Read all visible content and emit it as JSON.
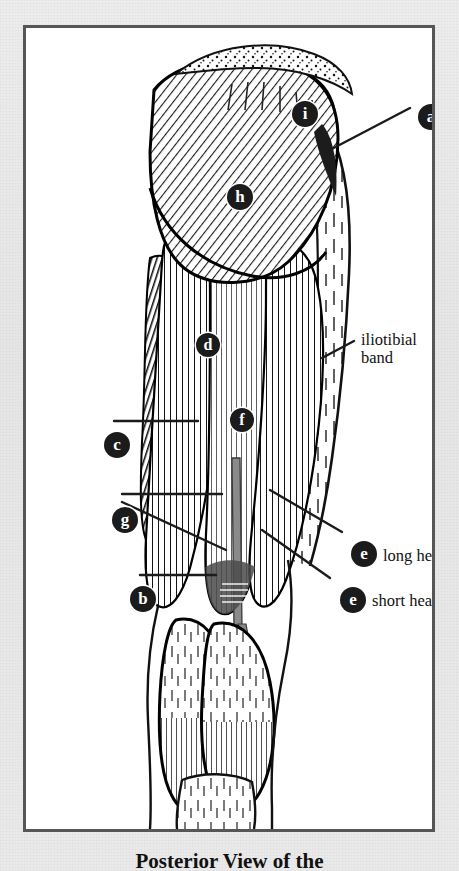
{
  "figure": {
    "caption": "Posterior View of the",
    "see_page_note": "see page 354",
    "frame_color": "#565656",
    "page_background": "#e9e9e9",
    "plate_background": "#ffffff",
    "marker_color": "#1b1b1b",
    "ink_color": "#111111"
  },
  "text_labels": [
    {
      "id": "iliotibial",
      "line1": "iliotibial",
      "line2": "band"
    },
    {
      "id": "long-head",
      "text": "long head"
    },
    {
      "id": "short-head",
      "text": "short head"
    }
  ],
  "markers": [
    {
      "key": "a",
      "letter": "a",
      "x": 392,
      "y": 76
    },
    {
      "key": "i",
      "letter": "i",
      "x": 266,
      "y": 73
    },
    {
      "key": "h",
      "letter": "h",
      "x": 201,
      "y": 156
    },
    {
      "key": "d",
      "letter": "d",
      "x": 170,
      "y": 305
    },
    {
      "key": "f",
      "letter": "f",
      "x": 204,
      "y": 380
    },
    {
      "key": "c",
      "letter": "c",
      "x": 78,
      "y": 404
    },
    {
      "key": "g",
      "letter": "g",
      "x": 86,
      "y": 479
    },
    {
      "key": "b",
      "letter": "b",
      "x": 104,
      "y": 558
    },
    {
      "key": "e-long",
      "letter": "e",
      "x": 325,
      "y": 513
    },
    {
      "key": "e-short",
      "letter": "e",
      "x": 314,
      "y": 559
    }
  ],
  "anatomy": {
    "structures": [
      "gluteus maximus",
      "gluteus medius",
      "iliotibial band",
      "biceps femoris long head",
      "biceps femoris short head",
      "semitendinosus",
      "semimembranosus",
      "adductor magnus",
      "gracilis",
      "sciatic nerve",
      "gastrocnemius medial head",
      "gastrocnemius lateral head"
    ]
  }
}
